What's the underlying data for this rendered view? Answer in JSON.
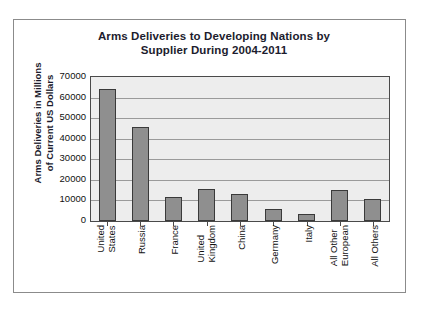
{
  "chart_data": {
    "type": "bar",
    "title": "Arms Deliveries to Developing Nations by Supplier During 2004-2011",
    "title_line1": "Arms Deliveries to Developing Nations by",
    "title_line2": "Supplier During 2004-2011",
    "xlabel": "",
    "ylabel": "Arms Deliveries in Millions of Current US Dollars",
    "ylabel_line1": "Arms Deliveries in Millions",
    "ylabel_line2": "of Current US Dollars",
    "categories": [
      "United States",
      "Russia",
      "France",
      "United Kingdom",
      "China",
      "Germany",
      "Italy",
      "All Other European",
      "All Others"
    ],
    "category_lines": [
      [
        "United",
        "States"
      ],
      [
        "Russia",
        ""
      ],
      [
        "France",
        ""
      ],
      [
        "United",
        "Kingdom"
      ],
      [
        "China",
        ""
      ],
      [
        "Germany",
        ""
      ],
      [
        "Italy",
        ""
      ],
      [
        "All Other",
        "European"
      ],
      [
        "All Others",
        ""
      ]
    ],
    "values": [
      64200,
      45800,
      11500,
      15700,
      13000,
      6000,
      3400,
      15000,
      10700
    ],
    "ylim": [
      0,
      70000
    ],
    "ytick_values": [
      70000,
      60000,
      50000,
      40000,
      30000,
      20000,
      10000,
      0
    ],
    "ytick_labels": [
      "70000",
      "60000",
      "50000",
      "40000",
      "30000",
      "20000",
      "10000",
      "0"
    ],
    "grid": true,
    "legend": false,
    "bar_color": "#8f8f8f",
    "bar_edge_color": "#3a3a3a",
    "plot_background": "#ededed",
    "gridline_color": "#9a9a9a",
    "text_color": "#101010"
  }
}
